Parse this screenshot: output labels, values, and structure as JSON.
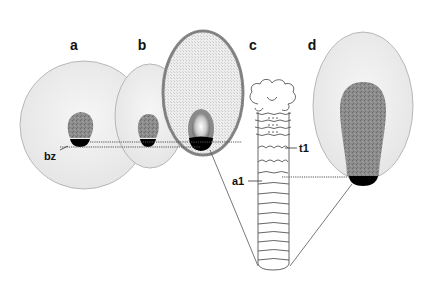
{
  "figure": {
    "panels": [
      {
        "id": "a",
        "label": "a"
      },
      {
        "id": "b",
        "label": "b"
      },
      {
        "id": "c",
        "label": "c"
      },
      {
        "id": "d",
        "label": "d"
      }
    ],
    "annotations": {
      "bz": "bz",
      "t1": "t1",
      "a1": "a1"
    },
    "colors": {
      "egg_fill": "#ececec",
      "egg_stroke": "#a8a8a8",
      "germ_fill": "#8a8a8a",
      "band_black": "#000000",
      "chorion_stroke": "#888888",
      "line": "#333333"
    }
  }
}
